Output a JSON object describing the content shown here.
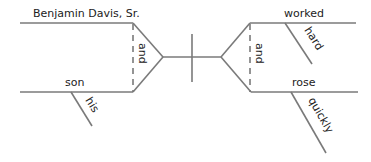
{
  "diagram": {
    "type": "sentence-diagram",
    "sentence_parts": {
      "subjects": [
        {
          "word": "Benjamin Davis, Sr.",
          "modifiers": []
        },
        {
          "word": "son",
          "modifiers": [
            "his"
          ]
        }
      ],
      "subject_conjunction": "and",
      "predicates": [
        {
          "word": "worked",
          "modifiers": [
            "hard"
          ]
        },
        {
          "word": "rose",
          "modifiers": [
            "quickly"
          ]
        }
      ],
      "predicate_conjunction": "and"
    },
    "labels": {
      "subject_1": "Benjamin Davis, Sr.",
      "subject_2": "son",
      "subject_2_modifier": "his",
      "subject_conjunction": "and",
      "predicate_1": "worked",
      "predicate_1_modifier": "hard",
      "predicate_2": "rose",
      "predicate_2_modifier": "quickly",
      "predicate_conjunction": "and"
    },
    "colors": {
      "line": "#7a7a7a",
      "text": "#222222"
    }
  }
}
